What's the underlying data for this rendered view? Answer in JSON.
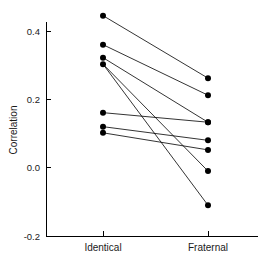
{
  "chart_data": {
    "type": "line",
    "title": "",
    "subtitle": "",
    "xlabel": "",
    "ylabel": "Correlation",
    "categories": [
      "Identical",
      "Fraternal"
    ],
    "x": [
      0,
      1
    ],
    "ylim": [
      -0.2,
      0.46
    ],
    "yticks": [
      -0.2,
      0.0,
      0.2,
      0.4
    ],
    "ytick_labels": [
      "-0.2",
      "0.0",
      "0.2",
      "0.4"
    ],
    "xticks": [
      0,
      1
    ],
    "grid": false,
    "legend": "none",
    "annotations": [],
    "series": [
      {
        "name": "pair-1",
        "values": [
          0.445,
          0.262
        ]
      },
      {
        "name": "pair-2",
        "values": [
          0.36,
          0.212
        ]
      },
      {
        "name": "pair-3",
        "values": [
          0.322,
          0.133
        ]
      },
      {
        "name": "pair-4",
        "values": [
          0.303,
          -0.01
        ]
      },
      {
        "name": "pair-5",
        "values": [
          0.161,
          0.133
        ]
      },
      {
        "name": "pair-6",
        "values": [
          0.12,
          0.08
        ]
      },
      {
        "name": "pair-7",
        "values": [
          0.102,
          0.052
        ]
      },
      {
        "name": "pair-8",
        "values": [
          0.303,
          -0.11
        ]
      }
    ],
    "points": {
      "identical": [
        0.445,
        0.36,
        0.322,
        0.303,
        0.161,
        0.12,
        0.102
      ],
      "fraternal": [
        0.262,
        0.212,
        0.133,
        0.133,
        0.08,
        0.052,
        -0.01,
        -0.11
      ]
    },
    "colors": {
      "line": "#000000",
      "marker": "#000000",
      "axis": "#000000",
      "background": "#ffffff"
    }
  }
}
